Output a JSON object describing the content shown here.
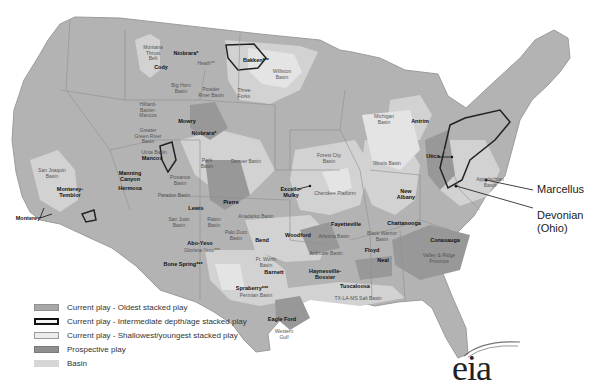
{
  "map": {
    "colors": {
      "background": "#ffffff",
      "land": "#b3b3b3",
      "state_border": "#8e8e8e",
      "oldest_play": "#a8a8a8",
      "intermediate_outline": "#222222",
      "shallowest_play": "#e2e2e2",
      "prospective_play": "#959595",
      "basin": "#d2d2d2"
    },
    "labels": [
      {
        "text": "Montana\nThrust\nBelt",
        "x": 153,
        "y": 53,
        "kind": "basin"
      },
      {
        "text": "Niobrara*",
        "x": 186,
        "y": 54,
        "kind": "play"
      },
      {
        "text": "Heath**",
        "x": 206,
        "y": 64,
        "kind": "basin"
      },
      {
        "text": "Bakken***",
        "x": 256,
        "y": 61,
        "kind": "play"
      },
      {
        "text": "Williston\nBasin",
        "x": 282,
        "y": 74,
        "kind": "basin"
      },
      {
        "text": "Cody",
        "x": 161,
        "y": 68,
        "kind": "play"
      },
      {
        "text": "Big Horn\nBasin",
        "x": 181,
        "y": 88,
        "kind": "basin"
      },
      {
        "text": "Powder\nRiver Basin",
        "x": 211,
        "y": 92,
        "kind": "basin"
      },
      {
        "text": "Three\nForks",
        "x": 244,
        "y": 93,
        "kind": "basin"
      },
      {
        "text": "Hilliard-\nBaxter-\nMancos",
        "x": 148,
        "y": 110,
        "kind": "basin"
      },
      {
        "text": "Mowry",
        "x": 187,
        "y": 122,
        "kind": "play"
      },
      {
        "text": "Greater\nGreen River\nBasin",
        "x": 148,
        "y": 136,
        "kind": "basin"
      },
      {
        "text": "Niobrara*",
        "x": 204,
        "y": 134,
        "kind": "play"
      },
      {
        "text": "Uinta Basin",
        "x": 154,
        "y": 153,
        "kind": "basin"
      },
      {
        "text": "Mancos",
        "x": 152,
        "y": 159,
        "kind": "play"
      },
      {
        "text": "Park\nBasin",
        "x": 207,
        "y": 163,
        "kind": "basin"
      },
      {
        "text": "Denver Basin",
        "x": 246,
        "y": 162,
        "kind": "basin"
      },
      {
        "text": "Manning\nCanyon",
        "x": 130,
        "y": 176,
        "kind": "play"
      },
      {
        "text": "Hermosa",
        "x": 130,
        "y": 189,
        "kind": "play"
      },
      {
        "text": "Piceance\nBasin",
        "x": 180,
        "y": 180,
        "kind": "basin"
      },
      {
        "text": "Paradox Basin",
        "x": 174,
        "y": 196,
        "kind": "basin"
      },
      {
        "text": "Pierre",
        "x": 231,
        "y": 203,
        "kind": "play"
      },
      {
        "text": "Lewis",
        "x": 196,
        "y": 209,
        "kind": "play"
      },
      {
        "text": "San Joaquin\nBasin",
        "x": 52,
        "y": 173,
        "kind": "basin"
      },
      {
        "text": "Monterey-\nTemblor",
        "x": 70,
        "y": 192,
        "kind": "play"
      },
      {
        "text": "Monterey",
        "x": 28,
        "y": 219,
        "kind": "play"
      },
      {
        "text": "San Juan\nBasin",
        "x": 179,
        "y": 222,
        "kind": "basin"
      },
      {
        "text": "Raton\nBasin",
        "x": 214,
        "y": 222,
        "kind": "basin"
      },
      {
        "text": "Anadarko Basin",
        "x": 256,
        "y": 217,
        "kind": "basin"
      },
      {
        "text": "Palo Duro\nBasin",
        "x": 236,
        "y": 235,
        "kind": "basin"
      },
      {
        "text": "Bend",
        "x": 262,
        "y": 241,
        "kind": "play"
      },
      {
        "text": "Abo-Yeso",
        "x": 200,
        "y": 244,
        "kind": "play"
      },
      {
        "text": "Glorieta-Yeso***",
        "x": 202,
        "y": 251,
        "kind": "basin"
      },
      {
        "text": "Bone Spring***",
        "x": 183,
        "y": 265,
        "kind": "play"
      },
      {
        "text": "Ft. Worth\nBasin",
        "x": 266,
        "y": 262,
        "kind": "basin"
      },
      {
        "text": "Barnett",
        "x": 274,
        "y": 273,
        "kind": "play"
      },
      {
        "text": "Spraberry***",
        "x": 252,
        "y": 289,
        "kind": "play"
      },
      {
        "text": "Permian Basin",
        "x": 256,
        "y": 296,
        "kind": "basin"
      },
      {
        "text": "Eagle Ford",
        "x": 282,
        "y": 320,
        "kind": "play"
      },
      {
        "text": "Western\nGulf",
        "x": 284,
        "y": 334,
        "kind": "basin"
      },
      {
        "text": "Haynesville-\nBossier",
        "x": 325,
        "y": 274,
        "kind": "play"
      },
      {
        "text": "Tuscaloosa",
        "x": 355,
        "y": 287,
        "kind": "play"
      },
      {
        "text": "TX-LA-MS Salt Basin",
        "x": 358,
        "y": 299,
        "kind": "basin"
      },
      {
        "text": "Woodford",
        "x": 298,
        "y": 236,
        "kind": "play"
      },
      {
        "text": "Ardmore Basin",
        "x": 326,
        "y": 254,
        "kind": "basin"
      },
      {
        "text": "Arkoma Basin",
        "x": 334,
        "y": 237,
        "kind": "basin"
      },
      {
        "text": "Fayetteville",
        "x": 346,
        "y": 225,
        "kind": "play"
      },
      {
        "text": "Excello-\nMulky",
        "x": 291,
        "y": 192,
        "kind": "play"
      },
      {
        "text": "Cherokee Platform",
        "x": 335,
        "y": 194,
        "kind": "basin"
      },
      {
        "text": "Forest City\nBasin",
        "x": 329,
        "y": 158,
        "kind": "basin"
      },
      {
        "text": "Illinois Basin",
        "x": 387,
        "y": 164,
        "kind": "basin"
      },
      {
        "text": "New\nAlbany",
        "x": 406,
        "y": 194,
        "kind": "play"
      },
      {
        "text": "Michigan\nBasin",
        "x": 384,
        "y": 119,
        "kind": "basin"
      },
      {
        "text": "Antrim",
        "x": 420,
        "y": 122,
        "kind": "play"
      },
      {
        "text": "Utica",
        "x": 433,
        "y": 157,
        "kind": "play"
      },
      {
        "text": "Appalachian\nBasin",
        "x": 490,
        "y": 182,
        "kind": "basin"
      },
      {
        "text": "Chattanooga",
        "x": 404,
        "y": 224,
        "kind": "play"
      },
      {
        "text": "Black Warrior\nBasin",
        "x": 382,
        "y": 236,
        "kind": "basin"
      },
      {
        "text": "Floyd",
        "x": 372,
        "y": 251,
        "kind": "play"
      },
      {
        "text": "Neal",
        "x": 383,
        "y": 261,
        "kind": "play"
      },
      {
        "text": "Conasauga",
        "x": 445,
        "y": 241,
        "kind": "play"
      },
      {
        "text": "Valley & Ridge\nProvince",
        "x": 439,
        "y": 258,
        "kind": "basin"
      }
    ],
    "callouts": [
      {
        "text": "Marcellus",
        "x": 537,
        "y": 190
      },
      {
        "text": "Devonian\n(Ohio)",
        "x": 537,
        "y": 216
      }
    ]
  },
  "legend": {
    "items": [
      {
        "label": "Current play - Oldest stacked play",
        "fill": "#a8a8a8",
        "border": "#8f8f8f",
        "border_width": "1px"
      },
      {
        "label": "Current play - Intermediate depth/age stacked play",
        "fill": "#f5f5f5",
        "border": "#111111",
        "border_width": "2px"
      },
      {
        "label": "Current play - Shallowest/youngest stacked play",
        "fill": "#ececec",
        "border": "#9a9a9a",
        "border_width": "1px"
      },
      {
        "label": "Prospective play",
        "fill": "#8f8f8f",
        "border": "#7a7a7a",
        "border_width": "1px"
      },
      {
        "label": "Basin",
        "fill": "#d6d6d6",
        "border": "#d6d6d6",
        "border_width": "1px"
      }
    ]
  },
  "logo": {
    "text": "eia"
  }
}
